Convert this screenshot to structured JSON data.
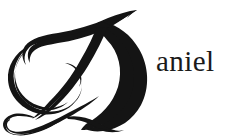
{
  "image": {
    "kind": "logo-wordmark",
    "width": 236,
    "height": 137,
    "background_color": "#ffffff",
    "ink_color": "#141414"
  },
  "logo": {
    "full_text": "Daniel",
    "drop_cap": {
      "letter": "D",
      "style": "calligraphic-swash-capital",
      "color": "#141414",
      "description": "Ornate script capital D with crossing top flourish and looping bottom flourish"
    },
    "wordmark": {
      "text": "aniel",
      "style": "serif",
      "color": "#1a1a1a",
      "font_size_px": 29
    }
  }
}
